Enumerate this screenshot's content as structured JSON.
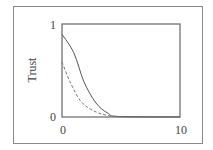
{
  "chart_data": {
    "type": "line",
    "title": "",
    "xlabel": "",
    "ylabel": "Trust",
    "xlim": [
      0,
      10
    ],
    "ylim": [
      0,
      1
    ],
    "x_ticks": [
      "0",
      "10"
    ],
    "y_ticks": [
      "0",
      "1"
    ],
    "grid": false,
    "legend": null,
    "series": [
      {
        "name": "solid",
        "style": "solid",
        "color": "#555555",
        "x": [
          0,
          1,
          1.86,
          2.88,
          3.9,
          4.9,
          10
        ],
        "values": [
          0.89,
          0.69,
          0.38,
          0.15,
          0.04,
          0.005,
          0
        ]
      },
      {
        "name": "dashed",
        "style": "dashed",
        "color": "#777777",
        "x": [
          0,
          0.68,
          1.53,
          2.54,
          3.9,
          5.76,
          10
        ],
        "values": [
          0.59,
          0.38,
          0.18,
          0.075,
          0.016,
          0,
          0
        ]
      }
    ]
  },
  "labels": {
    "ylabel": "Trust",
    "ytick_top": "1",
    "ytick_bottom": "0",
    "xtick_left": "0",
    "xtick_right": "10"
  }
}
